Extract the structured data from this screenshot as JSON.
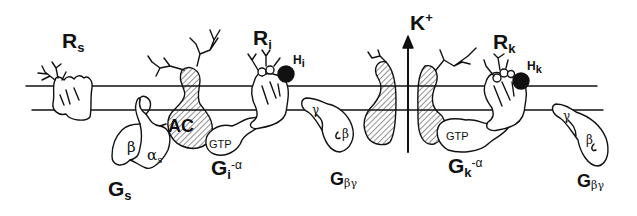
{
  "diagram": {
    "title": "",
    "labels": {
      "rs": {
        "main": "R",
        "sub": "s"
      },
      "ri": {
        "main": "R",
        "sub": "i"
      },
      "hi": {
        "main": "H",
        "sub": "i"
      },
      "ac": "AC",
      "gs": {
        "main": "G",
        "sub": "s"
      },
      "beta_s": "β",
      "alpha_s": {
        "main": "α",
        "sub": "s"
      },
      "gtp_i": "GTP",
      "gi_alpha": {
        "main": "G",
        "sub": "i",
        "sup": "-α"
      },
      "gbg_left": {
        "main": "G",
        "sub": "βγ"
      },
      "gamma_left": "γ",
      "beta_left": "β",
      "kplus": {
        "main": "K",
        "sup": "+"
      },
      "rk": {
        "main": "R",
        "sub": "k"
      },
      "hk": {
        "main": "H",
        "sub": "k"
      },
      "gtp_k": "GTP",
      "gk_alpha": {
        "main": "G",
        "sub": "k",
        "sup": "-α"
      },
      "gbg_right": {
        "main": "G",
        "sub": "βγ"
      },
      "gamma_right": "γ",
      "beta_right": "β"
    },
    "colors": {
      "ink": "#111111",
      "background": "#ffffff"
    }
  }
}
